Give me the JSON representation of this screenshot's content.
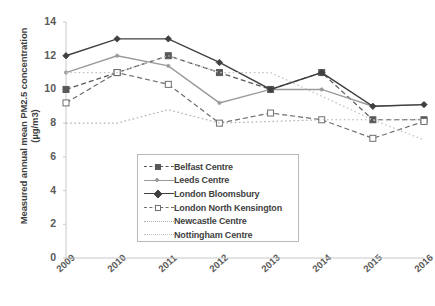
{
  "chart_data": {
    "type": "line",
    "title": "",
    "xlabel": "",
    "ylabel": "Measured annual mean PM2.5 concentration (µg/m3)",
    "categories": [
      "2009",
      "2010",
      "2011",
      "2012",
      "2013",
      "2014",
      "2015",
      "2016"
    ],
    "ylim": [
      0,
      14
    ],
    "yticks": [
      0,
      2,
      4,
      6,
      8,
      10,
      12,
      14
    ],
    "grid": false,
    "legend_position": "inside-bottom-center",
    "series": [
      {
        "name": "Belfast Centre",
        "color": "#595959",
        "style": "dashed",
        "marker": "square-filled",
        "values": [
          10.0,
          11.0,
          12.0,
          11.0,
          10.0,
          11.0,
          8.2,
          8.2
        ]
      },
      {
        "name": "Leeds Centre",
        "color": "#9a9a9a",
        "style": "solid",
        "marker": "dot",
        "values": [
          11.0,
          12.0,
          11.4,
          9.2,
          10.0,
          10.0,
          9.0,
          9.1
        ]
      },
      {
        "name": "London Bloomsbury",
        "color": "#404040",
        "style": "solid",
        "marker": "diamond",
        "values": [
          12.0,
          13.0,
          13.0,
          11.6,
          10.0,
          11.0,
          9.0,
          9.1
        ]
      },
      {
        "name": "London North Kensington",
        "color": "#6e6e6e",
        "style": "dashed",
        "marker": "square-open",
        "values": [
          9.2,
          11.0,
          10.3,
          8.0,
          8.6,
          8.2,
          7.1,
          8.1
        ]
      },
      {
        "name": "Newcastle Centre",
        "color": "#b0b0b0",
        "style": "dotted",
        "marker": "none",
        "values": [
          8.0,
          8.0,
          8.8,
          8.0,
          8.1,
          8.2,
          8.2,
          8.2
        ]
      },
      {
        "name": "Nottingham Centre",
        "color": "#c2c2c2",
        "style": "dotted",
        "marker": "none",
        "values": [
          11.0,
          11.0,
          12.0,
          11.0,
          11.0,
          9.6,
          8.2,
          7.0
        ]
      }
    ]
  }
}
